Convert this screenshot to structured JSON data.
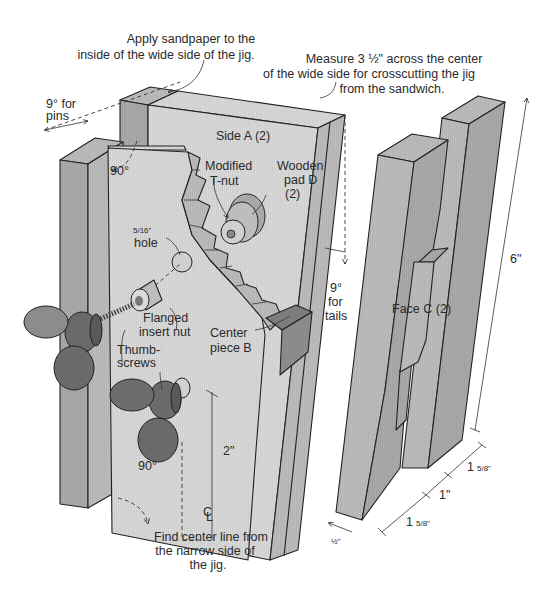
{
  "figure": {
    "type": "exploded-isometric-woodworking-diagram"
  },
  "colors": {
    "background": "#ffffff",
    "face_light": "#d6d6d6",
    "face_mid": "#bdbdbd",
    "face_dark": "#a9a9a9",
    "face_c": "#b4b4b4",
    "center_piece": "#8a8a8a",
    "thumbscrew": "#6f6f6f",
    "thumbscrew_dark": "#5a5a5a",
    "tnut": "#9a9a9a",
    "line": "#222222"
  },
  "annotations": {
    "sandpaper": {
      "line1": "Apply sandpaper to the",
      "line2": "inside of the wide side of the jig."
    },
    "measure": {
      "line1": "Measure 3 ½\" across the center",
      "line2": "of the wide side for crosscutting the jig",
      "line3": "from the sandwich."
    },
    "pins_angle": {
      "line1": "9° for",
      "line2": "pins"
    },
    "tails_angle": {
      "line1": "9°",
      "line2": "for",
      "line3": "tails"
    },
    "top_right_angle": "90°",
    "bottom_left_angle": "90°",
    "center_line": {
      "line1": "Find center line from",
      "line2": "the narrow side of",
      "line3": "the jig.",
      "symbol": "C",
      "symbol_sub": "L"
    },
    "height_2in": "2\""
  },
  "parts": {
    "side_a": "Side A (2)",
    "modified_tnut": {
      "line1": "Modified",
      "line2": "T-nut"
    },
    "wooden_pad": {
      "line1": "Wooden",
      "line2": "pad D",
      "line3": "(2)"
    },
    "hole": {
      "size": "5/16\"",
      "label": "hole"
    },
    "flanged_insert_nut": {
      "line1": "Flanged",
      "line2": "insert nut"
    },
    "thumbscrews": {
      "line1": "Thumb-",
      "line2": "screws"
    },
    "center_piece": {
      "line1": "Center",
      "line2": "piece B"
    },
    "face_c": "Face C (2)"
  },
  "dimensions": {
    "height": "6\"",
    "thickness": "½\"",
    "left_width": {
      "whole": "1",
      "frac": "5/8\""
    },
    "slot_width": "1\"",
    "right_width": {
      "whole": "1",
      "frac": "5/8\""
    }
  }
}
